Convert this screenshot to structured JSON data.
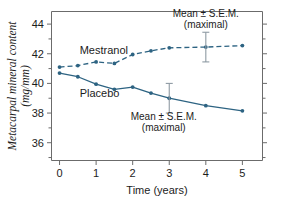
{
  "chart_data": {
    "type": "line",
    "title": "",
    "xlabel": "Time (years)",
    "ylabel": "Metacarpal mineral content (mg/mm)",
    "ylabel_line1": "Metacarpal mineral content",
    "ylabel_line2": "(mg/mm)",
    "xlim": [
      -0.22,
      5.55
    ],
    "ylim": [
      34.8,
      44.85
    ],
    "xticks": [
      0,
      1,
      2,
      3,
      4,
      5
    ],
    "xticklabels": [
      "0",
      "1",
      "2",
      "3",
      "4",
      "5"
    ],
    "yticks": [
      36,
      38,
      40,
      42,
      44
    ],
    "yticklabels": [
      "36",
      "38",
      "40",
      "42",
      "44"
    ],
    "y_minor_ticks": [
      35,
      37,
      39,
      41,
      43
    ],
    "grid": false,
    "legend": "inline-labels",
    "series": [
      {
        "name": "Mestranol",
        "style": "dashed",
        "color": "#2d6382",
        "label_x": 0.55,
        "label_y": 42.25,
        "x": [
          0,
          0.5,
          1,
          1.5,
          2,
          2.5,
          3,
          4,
          5
        ],
        "values": [
          41.1,
          41.2,
          41.45,
          41.35,
          41.95,
          42.2,
          42.4,
          42.45,
          42.55
        ],
        "error_bar": {
          "x": 4,
          "y": 42.45,
          "sem": 1.0
        }
      },
      {
        "name": "Placebo",
        "style": "solid",
        "color": "#2d6382",
        "label_x": 0.55,
        "label_y": 39.35,
        "x": [
          0,
          0.5,
          1,
          1.5,
          2,
          2.5,
          3,
          4,
          5
        ],
        "values": [
          40.7,
          40.45,
          39.95,
          39.6,
          39.75,
          39.35,
          39.0,
          38.5,
          38.15
        ],
        "error_bar": {
          "x": 3,
          "y": 39.0,
          "sem": 1.0
        }
      }
    ],
    "annotations": [
      {
        "id": "annotation-mestranol",
        "line1": "Mean ± S.E.M.",
        "line2": "(maximal)",
        "x": 4.0,
        "y": 44.5
      },
      {
        "id": "annotation-placebo",
        "line1": "Mean ± S.E.M.",
        "line2": "(maximal)",
        "x": 2.85,
        "y": 37.5
      }
    ],
    "colors": {
      "series": "#2d6382",
      "axis": "#6b6b6b",
      "text": "#1c1c1c",
      "background": "#ffffff"
    }
  }
}
